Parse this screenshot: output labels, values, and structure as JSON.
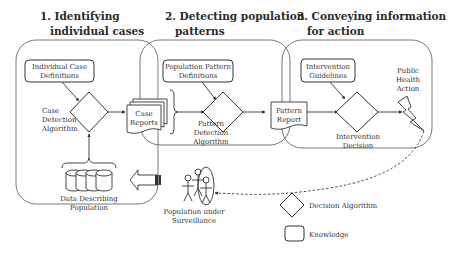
{
  "sections": [
    {
      "title_line1": "1. Identifying",
      "title_line2": "individual cases"
    },
    {
      "title_line1": "2. Detecting population",
      "title_line2": "patterns"
    },
    {
      "title_line1": "3. Conveying information",
      "title_line2": "for action"
    }
  ],
  "nodes": {
    "individual_case_definitions": {
      "line1": "Individual Case",
      "line2": "Definitions"
    },
    "case_detection_algorithm": {
      "line1": "Case",
      "line2": "Detection",
      "line3": "Algorithm"
    },
    "case_reports": {
      "line1": "Case",
      "line2": "Reports"
    },
    "data_describing_population": {
      "line1": "Data Describing",
      "line2": "Population"
    },
    "population_pattern_definitions": {
      "line1": "Population Pattern",
      "line2": "Definitions"
    },
    "pattern_detection_algorithm": {
      "line1": "Pattern",
      "line2": "Detection",
      "line3": "Algorithm"
    },
    "pattern_report": {
      "line1": "Pattern",
      "line2": "Report"
    },
    "intervention_guidelines": {
      "line1": "Intervention",
      "line2": "Guidelines"
    },
    "intervention_decision": {
      "line1": "Intervention",
      "line2": "Decision"
    },
    "public_health_action": {
      "line1": "Public",
      "line2": "Health",
      "line3": "Action"
    },
    "population_under_surveillance": {
      "line1": "Population under",
      "line2": "Surveillance"
    }
  },
  "legend": {
    "decision_algorithm": "Decision Algorithm",
    "knowledge": "Knowledge"
  },
  "colors": {
    "stroke": "#333333",
    "panel_border": "#555555",
    "text": "#333333"
  }
}
